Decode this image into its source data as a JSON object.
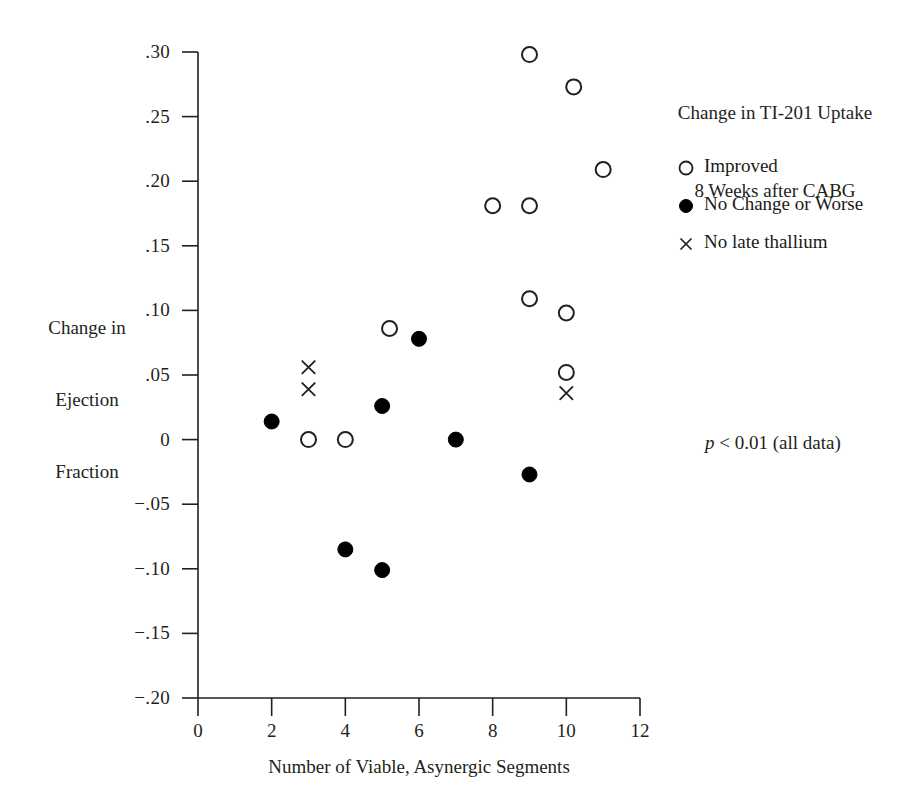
{
  "chart_data": {
    "type": "scatter",
    "title": "Change in TI-201 Uptake 8 Weeks after CABG",
    "title_line1": "Change in TI-201 Uptake",
    "title_line2": "8 Weeks after CABG",
    "xlabel": "Number of Viable, Asynergic Segments",
    "ylabel": "Change in Ejection Fraction",
    "ylabel_line1": "Change in",
    "ylabel_line2": "Ejection",
    "ylabel_line3": "Fraction",
    "xlim": [
      0,
      12
    ],
    "ylim": [
      -0.2,
      0.3
    ],
    "xticks": [
      0,
      2,
      4,
      6,
      8,
      10,
      12
    ],
    "xtick_labels": [
      "0",
      "2",
      "4",
      "6",
      "8",
      "10",
      "12"
    ],
    "yticks": [
      0.3,
      0.25,
      0.2,
      0.15,
      0.1,
      0.05,
      0,
      -0.05,
      -0.1,
      -0.15,
      -0.2
    ],
    "ytick_labels": [
      ".30",
      ".25",
      ".20",
      ".15",
      ".10",
      ".05",
      "0",
      "−.05",
      "−.10",
      "−.15",
      "−.20"
    ],
    "grid": false,
    "legend_position": "upper right",
    "annotation": "p < 0.01 (all data)",
    "annotation_symbol": "p",
    "annotation_rest": " < 0.01 (all data)",
    "series": [
      {
        "name": "Improved",
        "marker": "open-circle",
        "color": "#231f20",
        "points": [
          {
            "x": 9,
            "y": 0.298
          },
          {
            "x": 10.2,
            "y": 0.273
          },
          {
            "x": 11,
            "y": 0.209
          },
          {
            "x": 8,
            "y": 0.181
          },
          {
            "x": 9,
            "y": 0.181
          },
          {
            "x": 9,
            "y": 0.109
          },
          {
            "x": 10,
            "y": 0.098
          },
          {
            "x": 5.2,
            "y": 0.086
          },
          {
            "x": 10,
            "y": 0.052
          },
          {
            "x": 3,
            "y": 0.0
          },
          {
            "x": 4,
            "y": 0.0
          }
        ]
      },
      {
        "name": "No Change or Worse",
        "marker": "filled-circle",
        "color": "#000000",
        "points": [
          {
            "x": 6,
            "y": 0.078
          },
          {
            "x": 5,
            "y": 0.026
          },
          {
            "x": 2,
            "y": 0.014
          },
          {
            "x": 7,
            "y": 0.0
          },
          {
            "x": 9,
            "y": -0.027
          },
          {
            "x": 4,
            "y": -0.085
          },
          {
            "x": 5,
            "y": -0.101
          }
        ]
      },
      {
        "name": "No late thallium",
        "marker": "cross",
        "color": "#231f20",
        "points": [
          {
            "x": 3,
            "y": 0.056
          },
          {
            "x": 3,
            "y": 0.039
          },
          {
            "x": 10,
            "y": 0.036
          }
        ]
      }
    ]
  },
  "legend": {
    "items": [
      {
        "label": "Improved",
        "marker": "open-circle"
      },
      {
        "label": "No Change or Worse",
        "marker": "filled-circle"
      },
      {
        "label": "No late thallium",
        "marker": "cross"
      }
    ]
  }
}
